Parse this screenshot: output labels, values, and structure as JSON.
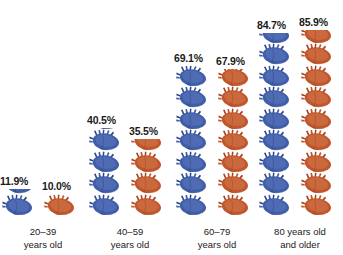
{
  "chart_data": {
    "type": "bar",
    "title": "",
    "subtitle": "",
    "xlabel": "",
    "ylabel": "",
    "unit": "%",
    "icon_unit_value": 10,
    "icon": "anatomical-heart-icon",
    "categories": [
      {
        "line1": "20–39",
        "line2": "years old"
      },
      {
        "line1": "40–59",
        "line2": "years old"
      },
      {
        "line1": "60–79",
        "line2": "years old"
      },
      {
        "line1": "80 years old",
        "line2": "and older"
      }
    ],
    "series": [
      {
        "name": "blue",
        "color": "#3f5da9",
        "values": [
          11.9,
          40.5,
          69.1,
          84.7
        ],
        "labels": [
          "11.9%",
          "40.5%",
          "69.1%",
          "84.7%"
        ]
      },
      {
        "name": "orange",
        "color": "#c1562c",
        "values": [
          10.0,
          35.5,
          67.9,
          85.9
        ],
        "labels": [
          "10.0%",
          "35.5%",
          "67.9%",
          "85.9%"
        ]
      }
    ],
    "ylim": [
      0,
      90
    ],
    "grid": false,
    "legend": "none"
  },
  "colors": {
    "blue": "#3f5da9",
    "blue_dark": "#2f4682",
    "blue_light": "#6b86c6",
    "orange": "#c1562c",
    "orange_dark": "#a1431f",
    "orange_light": "#dd8c5e",
    "text": "#1a1a1a",
    "background": "#ffffff"
  }
}
